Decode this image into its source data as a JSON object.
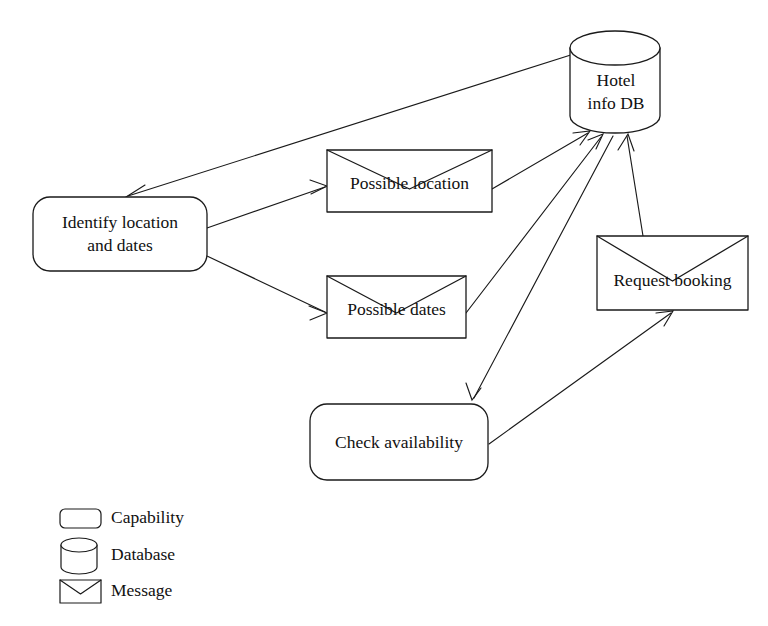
{
  "diagram": {
    "background_color": "#ffffff",
    "stroke_color": "#1a1a1a",
    "nodes": [
      {
        "id": "identify",
        "type": "capability",
        "label_line1": "Identify location",
        "label_line2": "and dates"
      },
      {
        "id": "possible_location",
        "type": "message",
        "label_line1": "Possible location",
        "label_line2": ""
      },
      {
        "id": "possible_dates",
        "type": "message",
        "label_line1": "Possible dates",
        "label_line2": ""
      },
      {
        "id": "hotel_db",
        "type": "database",
        "label_line1": "Hotel",
        "label_line2": "info DB"
      },
      {
        "id": "request_booking",
        "type": "message",
        "label_line1": "Request booking",
        "label_line2": ""
      },
      {
        "id": "check_availability",
        "type": "capability",
        "label_line1": "Check availability",
        "label_line2": ""
      }
    ],
    "edges": [
      {
        "id": "db-to-identify",
        "from": "hotel_db",
        "to": "identify"
      },
      {
        "id": "identify-to-possible-location",
        "from": "identify",
        "to": "possible_location"
      },
      {
        "id": "identify-to-possible-dates",
        "from": "identify",
        "to": "possible_dates"
      },
      {
        "id": "possible-location-to-db",
        "from": "possible_location",
        "to": "hotel_db"
      },
      {
        "id": "possible-dates-to-db",
        "from": "possible_dates",
        "to": "hotel_db"
      },
      {
        "id": "db-to-check-availability",
        "from": "hotel_db",
        "to": "check_availability"
      },
      {
        "id": "check-availability-to-request-booking",
        "from": "check_availability",
        "to": "request_booking"
      },
      {
        "id": "request-booking-to-db",
        "from": "request_booking",
        "to": "hotel_db"
      }
    ],
    "legend": {
      "items": [
        {
          "id": "capability",
          "shape": "rounded-rectangle",
          "label": "Capability"
        },
        {
          "id": "database",
          "shape": "cylinder",
          "label": "Database"
        },
        {
          "id": "message",
          "shape": "envelope",
          "label": "Message"
        }
      ]
    }
  }
}
